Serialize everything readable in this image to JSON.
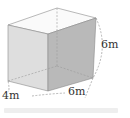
{
  "diagram": {
    "type": "rectangular-prism",
    "dimensions": {
      "height": "6 m",
      "width": "4 m",
      "depth": "6 m"
    },
    "labels": {
      "height": "6m",
      "width": "4m",
      "depth": "6m"
    },
    "colors": {
      "front_face": "#dedede",
      "right_face": "#b9b9b9",
      "top_face": "#fafafa",
      "edge": "#8a8a8a",
      "hidden_edge": "#9a9a9a",
      "label": "#333333"
    }
  }
}
